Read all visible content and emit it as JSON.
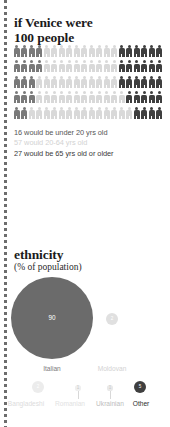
{
  "palette": {
    "ink": "#1b1b1b",
    "dark_figure": "#3f3f3f",
    "mid_figure": "#7a7a7a",
    "light_figure": "#d9d9d9",
    "faint_text": "#c9c9c9",
    "mid_text": "#9a9a9a",
    "bubble_dark": "#6b6b6b",
    "bubble_darkest": "#3f3f3f",
    "bubble_light": "#e2e2e2",
    "background": "#ffffff"
  },
  "population": {
    "title_line1": "if Venice were",
    "title_line2": "100 people",
    "pictogram": {
      "total": 100,
      "columns": 20,
      "rows": 5,
      "icon_name": "person-icon",
      "groups": [
        {
          "key": "under20",
          "count": 16,
          "color": "#7a7a7a"
        },
        {
          "key": "20to64",
          "count": 57,
          "color": "#d9d9d9"
        },
        {
          "key": "65plus",
          "count": 27,
          "color": "#3f3f3f"
        }
      ]
    },
    "legend": [
      {
        "value": 16,
        "text": "16 would be under 20 yrs old",
        "color": "#555555"
      },
      {
        "value": 57,
        "text": "57 would 20-64 yrs old",
        "color": "#d2d2d2"
      },
      {
        "value": 27,
        "text": "27 would be 65 yrs old or older",
        "color": "#3a3a3a"
      }
    ]
  },
  "ethnicity": {
    "title": "ethnicity",
    "subtitle": "(% of population)",
    "chart_type": "bubble",
    "items": [
      {
        "label": "Italian",
        "value": 90,
        "value_text": "90",
        "color": "#6b6b6b",
        "label_color": "#7c7c7c"
      },
      {
        "label": "Moldovan",
        "value": 2,
        "value_text": "2",
        "color": "#e0e0e0",
        "label_color": "#d2d2d2"
      },
      {
        "label": "Bangladeshi",
        "value": 2,
        "value_text": "2",
        "color": "#ececec",
        "label_color": "#dcdcdc"
      },
      {
        "label": "Romanian",
        "value": 1,
        "value_text": "1",
        "color": "#efefef",
        "label_color": "#e2e2e2"
      },
      {
        "label": "Ukrainian",
        "value": 1,
        "value_text": "1",
        "color": "#e9e9e9",
        "label_color": "#bdbdbd"
      },
      {
        "label": "Other",
        "value": 5,
        "value_text": "5",
        "color": "#3f3f3f",
        "label_color": "#2b2b2b"
      }
    ]
  },
  "chart_data": [
    {
      "type": "bar",
      "subtype": "pictogram",
      "title": "if Venice were 100 people",
      "categories": [
        "under 20 yrs old",
        "20-64 yrs old",
        "65 yrs old or older"
      ],
      "values": [
        16,
        57,
        27
      ],
      "unit": "people per 100",
      "xlabel": "",
      "ylabel": "",
      "legend": [
        "16 would be under 20 yrs old",
        "57 would 20-64 yrs old",
        "27 would be 65 yrs old or older"
      ]
    },
    {
      "type": "bubble",
      "title": "ethnicity",
      "subtitle": "(% of population)",
      "categories": [
        "Italian",
        "Moldovan",
        "Bangladeshi",
        "Romanian",
        "Ukrainian",
        "Other"
      ],
      "values": [
        90,
        2,
        2,
        1,
        1,
        5
      ],
      "unit": "% of population",
      "xlabel": "",
      "ylabel": "",
      "ylim": [
        0,
        100
      ]
    }
  ]
}
